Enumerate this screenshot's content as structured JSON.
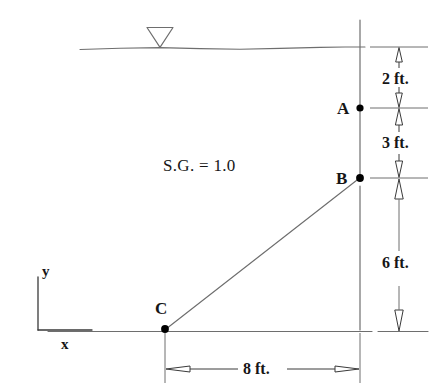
{
  "figure": {
    "fluid_label": "S.G. = 1.0",
    "points": [
      {
        "id": "A",
        "label": "A",
        "x": 360,
        "y": 108
      },
      {
        "id": "B",
        "label": "B",
        "x": 360,
        "y": 178
      },
      {
        "id": "C",
        "label": "C",
        "x": 165,
        "y": 329
      }
    ],
    "dimensions": [
      {
        "id": "top-to-a",
        "label": "2 ft.",
        "orientation": "vertical",
        "from_y": 47,
        "to_y": 108
      },
      {
        "id": "a-to-b",
        "label": "3 ft.",
        "orientation": "vertical",
        "from_y": 108,
        "to_y": 178
      },
      {
        "id": "b-to-base",
        "label": "6 ft.",
        "orientation": "vertical",
        "from_y": 178,
        "to_y": 332
      },
      {
        "id": "c-to-wall",
        "label": "8 ft.",
        "orientation": "horizontal",
        "from_x": 165,
        "to_x": 360
      }
    ],
    "axes": {
      "y_label": "y",
      "x_label": "x"
    },
    "water_surface": {
      "marker": "inverted-triangle-icon",
      "marker_x": 160,
      "surface_y": 47
    },
    "colors": {
      "stroke": "#3a3a3a",
      "stroke_light": "#6e6e6e",
      "text": "#161616",
      "fill_point": "#000000",
      "background": "#ffffff"
    }
  }
}
